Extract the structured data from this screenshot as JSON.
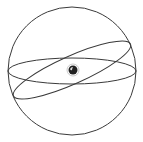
{
  "diagram": {
    "type": "celestial-sphere",
    "background": "#ffffff",
    "stroke_color": "#3a3a3a",
    "sphere": {
      "cx": 72,
      "cy": 71,
      "r": 64
    },
    "equator": {
      "cx": 72,
      "cy": 71,
      "rx": 64,
      "ry": 13,
      "rotation": 0
    },
    "ecliptic": {
      "cx": 72,
      "cy": 70,
      "rx": 64,
      "ry": 14,
      "rotation": -24
    },
    "earth": {
      "cx": 73,
      "cy": 70,
      "r": 4.5,
      "fill": "#222222",
      "ring_color": "#bbbbbb"
    }
  }
}
